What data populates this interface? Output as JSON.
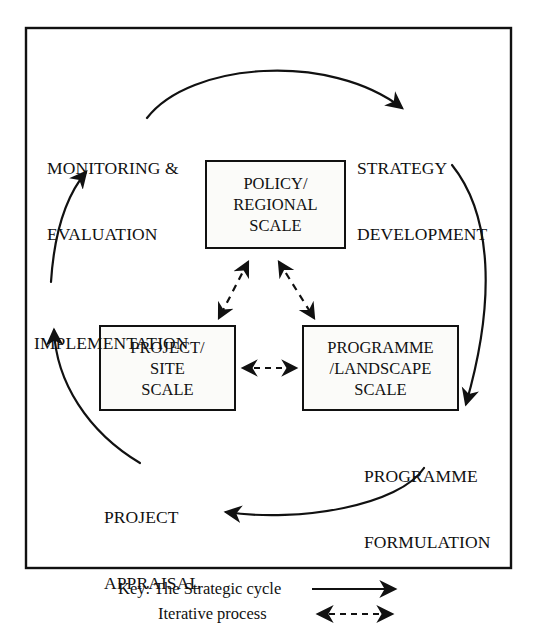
{
  "figure": {
    "boxes": [
      {
        "id": "policy-regional-scale",
        "lines": [
          "POLICY/",
          "REGIONAL",
          "SCALE"
        ]
      },
      {
        "id": "project-site-scale",
        "lines": [
          "PROJECT/",
          "SITE",
          "SCALE"
        ]
      },
      {
        "id": "programme-landscape-scale",
        "lines": [
          "PROGRAMME",
          "/LANDSCAPE",
          "SCALE"
        ]
      }
    ],
    "cycle_labels": [
      {
        "id": "monitoring-evaluation",
        "lines": [
          "MONITORING &",
          "EVALUATION"
        ]
      },
      {
        "id": "strategy-development",
        "lines": [
          "STRATEGY",
          "DEVELOPMENT"
        ]
      },
      {
        "id": "implementation",
        "lines": [
          "IMPLEMENTATION"
        ]
      },
      {
        "id": "programme-formulation",
        "lines": [
          "PROGRAMME",
          "FORMULATION"
        ]
      },
      {
        "id": "project-appraisal",
        "lines": [
          "PROJECT",
          "APPRAISAL"
        ]
      }
    ],
    "key": {
      "prefix": "Key:",
      "line1": "Key: The Strategic cycle",
      "line2": "Iterative process",
      "entries": [
        {
          "label": "The Strategic cycle",
          "line_style": "solid",
          "arrow": "single-headed-right"
        },
        {
          "label": "Iterative process",
          "line_style": "dashed",
          "arrow": "double-headed"
        }
      ]
    },
    "colors": {
      "line": "#111111",
      "box_fill": "#fbfbf9",
      "background": "#ffffff"
    },
    "cycle_direction": "clockwise",
    "cycle_sequence": [
      "MONITORING & EVALUATION",
      "STRATEGY DEVELOPMENT",
      "PROGRAMME FORMULATION",
      "PROJECT APPRAISAL",
      "IMPLEMENTATION"
    ]
  }
}
